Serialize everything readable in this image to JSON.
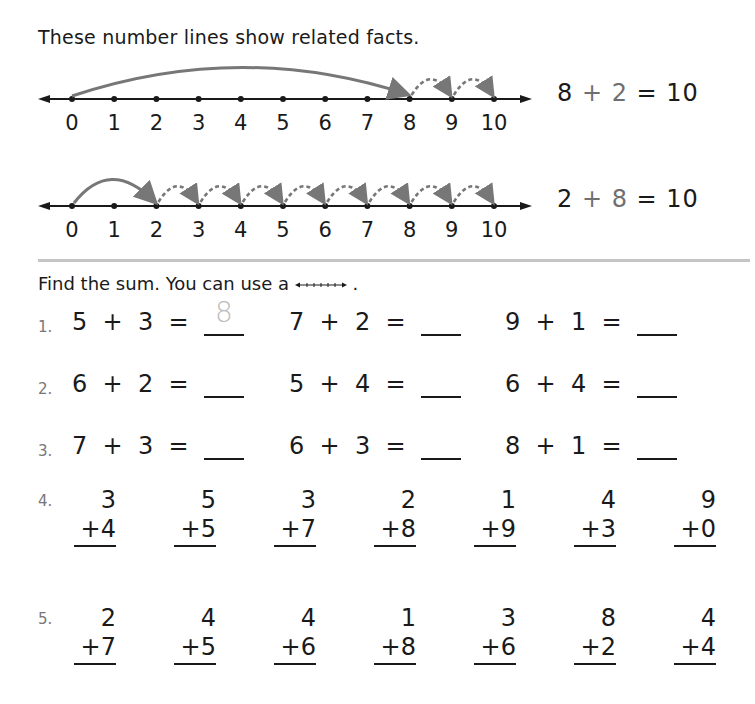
{
  "intro_text": "These number lines show related facts.",
  "number_lines": [
    {
      "ticks": [
        "0",
        "1",
        "2",
        "3",
        "4",
        "5",
        "6",
        "7",
        "8",
        "9",
        "10"
      ],
      "solid_jump": {
        "from": 0,
        "to": 8
      },
      "dashed_jumps": [
        [
          8,
          9
        ],
        [
          9,
          10
        ]
      ],
      "fact": {
        "a": "8",
        "op": "+",
        "b": "2",
        "eq": "=",
        "sum": "10"
      }
    },
    {
      "ticks": [
        "0",
        "1",
        "2",
        "3",
        "4",
        "5",
        "6",
        "7",
        "8",
        "9",
        "10"
      ],
      "solid_jump": {
        "from": 0,
        "to": 2
      },
      "dashed_jumps": [
        [
          2,
          3
        ],
        [
          3,
          4
        ],
        [
          4,
          5
        ],
        [
          5,
          6
        ],
        [
          6,
          7
        ],
        [
          7,
          8
        ],
        [
          8,
          9
        ],
        [
          9,
          10
        ]
      ],
      "fact": {
        "a": "2",
        "op": "+",
        "b": "8",
        "eq": "=",
        "sum": "10"
      }
    }
  ],
  "instruction": {
    "text": "Find the sum. You can use a",
    "icon": "number-line-icon",
    "period": "."
  },
  "horizontal_rows": [
    {
      "num": "1.",
      "problems": [
        {
          "a": "5",
          "b": "3",
          "answer": "8"
        },
        {
          "a": "7",
          "b": "2",
          "answer": ""
        },
        {
          "a": "9",
          "b": "1",
          "answer": ""
        }
      ]
    },
    {
      "num": "2.",
      "problems": [
        {
          "a": "6",
          "b": "2",
          "answer": ""
        },
        {
          "a": "5",
          "b": "4",
          "answer": ""
        },
        {
          "a": "6",
          "b": "4",
          "answer": ""
        }
      ]
    },
    {
      "num": "3.",
      "problems": [
        {
          "a": "7",
          "b": "3",
          "answer": ""
        },
        {
          "a": "6",
          "b": "3",
          "answer": ""
        },
        {
          "a": "8",
          "b": "1",
          "answer": ""
        }
      ]
    }
  ],
  "vertical_rows": [
    {
      "num": "4.",
      "problems": [
        {
          "top": "3",
          "bottom": "+4"
        },
        {
          "top": "5",
          "bottom": "+5"
        },
        {
          "top": "3",
          "bottom": "+7"
        },
        {
          "top": "2",
          "bottom": "+8"
        },
        {
          "top": "1",
          "bottom": "+9"
        },
        {
          "top": "4",
          "bottom": "+3"
        },
        {
          "top": "9",
          "bottom": "+0"
        }
      ]
    },
    {
      "num": "5.",
      "problems": [
        {
          "top": "2",
          "bottom": "+7"
        },
        {
          "top": "4",
          "bottom": "+5"
        },
        {
          "top": "4",
          "bottom": "+6"
        },
        {
          "top": "1",
          "bottom": "+8"
        },
        {
          "top": "3",
          "bottom": "+6"
        },
        {
          "top": "8",
          "bottom": "+2"
        },
        {
          "top": "4",
          "bottom": "+4"
        }
      ]
    }
  ],
  "symbols": {
    "plus": "+",
    "equals": "="
  },
  "colors": {
    "jump_gray": "#777777",
    "divider": "#c4c4c4",
    "traced_answer": "#bdbdbd"
  }
}
